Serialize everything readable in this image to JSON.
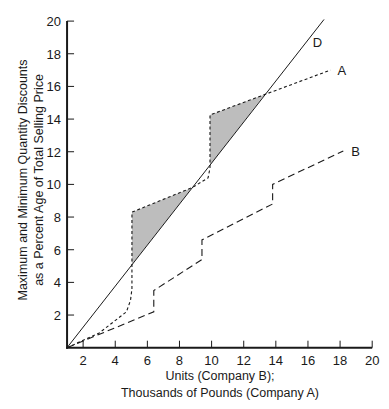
{
  "chart_data": {
    "type": "line",
    "title": "",
    "xlabel_lines": [
      "Units (Company B);",
      "Thousands of Pounds (Company A)"
    ],
    "ylabel_lines": [
      "Maximum and Minimum Quantity Discounts",
      "as a Percent Age of Total Selling Price"
    ],
    "xlim": [
      1,
      20
    ],
    "ylim": [
      0,
      20
    ],
    "x_ticks": [
      2,
      4,
      6,
      8,
      10,
      12,
      14,
      16,
      18,
      20
    ],
    "y_ticks": [
      2,
      4,
      6,
      8,
      10,
      12,
      14,
      16,
      18,
      20
    ],
    "grid": false,
    "series": [
      {
        "name": "D",
        "style": "solid",
        "points": [
          [
            1,
            0
          ],
          [
            17,
            20.1
          ]
        ]
      },
      {
        "name": "A",
        "style": "dotted",
        "points": [
          [
            1,
            0
          ],
          [
            3,
            0.9
          ],
          [
            4.7,
            2.2
          ],
          [
            4.95,
            2.9
          ],
          [
            5.04,
            3.6
          ],
          [
            5.04,
            8.3
          ],
          [
            8.78,
            9.8
          ],
          [
            9.78,
            10.4
          ],
          [
            9.9,
            11.0
          ],
          [
            9.9,
            14.25
          ],
          [
            13.3,
            15.5
          ],
          [
            17.4,
            17.0
          ]
        ]
      },
      {
        "name": "B",
        "style": "dashed",
        "points": [
          [
            1,
            0
          ],
          [
            6.4,
            2.2
          ],
          [
            6.4,
            3.5
          ],
          [
            9.4,
            5.4
          ],
          [
            9.4,
            6.6
          ],
          [
            13.8,
            8.8
          ],
          [
            13.8,
            10.0
          ],
          [
            18.2,
            12.05
          ]
        ]
      }
    ],
    "shaded_regions": [
      {
        "between": [
          "A",
          "D"
        ],
        "points": [
          [
            5.04,
            5.09
          ],
          [
            5.04,
            8.3
          ],
          [
            8.78,
            9.8
          ]
        ]
      },
      {
        "between": [
          "A",
          "D"
        ],
        "points": [
          [
            9.9,
            11.18
          ],
          [
            9.9,
            14.25
          ],
          [
            13.3,
            15.5
          ]
        ]
      }
    ],
    "colors": {
      "line": "#1a1a1a",
      "shade": "#bdbdbd"
    }
  }
}
